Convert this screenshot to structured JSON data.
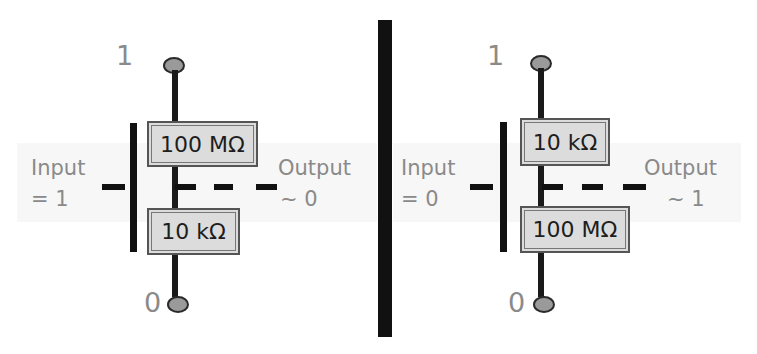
{
  "diagram": {
    "type": "resistor-switch-model",
    "colors": {
      "background": "#ffffff",
      "wire": "#1a1a1a",
      "resistor_fill": "#dcdcdc",
      "resistor_border": "#555555",
      "resistor_text": "#1e1e1e",
      "label_text": "#8a8a8a",
      "terminal_fill": "#9a9a9a",
      "divider": "#111111"
    },
    "panels": [
      {
        "top_rail_label": "1",
        "bottom_rail_label": "0",
        "top_resistor": "100 MΩ",
        "bottom_resistor": "10 kΩ",
        "input_label": "Input",
        "input_value": "= 1",
        "output_label": "Output",
        "output_value": "~ 0"
      },
      {
        "top_rail_label": "1",
        "bottom_rail_label": "0",
        "top_resistor": "10 kΩ",
        "bottom_resistor": "100 MΩ",
        "input_label": "Input",
        "input_value": "= 0",
        "output_label": "Output",
        "output_value": "~ 1"
      }
    ]
  }
}
